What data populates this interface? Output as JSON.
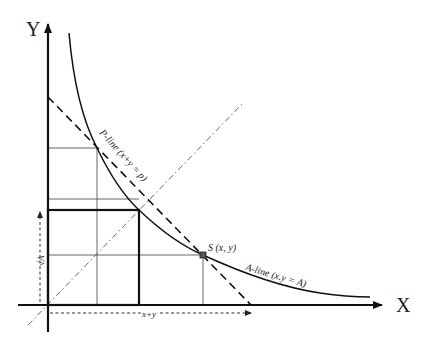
{
  "diagram": {
    "axes": {
      "x_label": "X",
      "y_label": "Y"
    },
    "curves": {
      "a_line_label": "A-line (x.y = A)",
      "p_line_label": "P-line (x+y = p)"
    },
    "point": {
      "label": "S (x, y)"
    },
    "dimensions": {
      "sqrt_a_label": "√A",
      "x_plus_y_label": "x+y"
    },
    "colors": {
      "stroke": "#111111",
      "grid": "#555555",
      "background": "#ffffff"
    }
  }
}
